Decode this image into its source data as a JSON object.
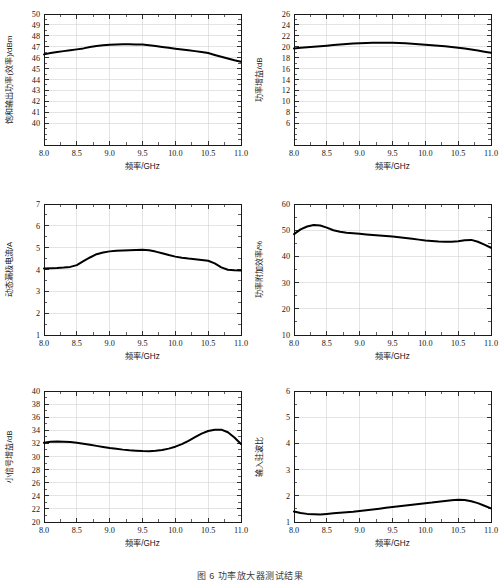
{
  "figure": {
    "caption": "图 6   功率放大器测试结果",
    "background": "#ffffff",
    "curve_color": "#000000",
    "grid_color": "#d2d2d2",
    "axis_color": "#1b1b1b",
    "panel_count": 6
  },
  "chart_data": [
    {
      "id": "saturated-output-power",
      "type": "line",
      "title": "",
      "xlabel": "频率/GHz",
      "ylabel": "饱和输出功率(效率)/dBm",
      "xlim": [
        8.0,
        11.0
      ],
      "ylim": [
        38.0,
        50.0
      ],
      "yticks": [
        40,
        41,
        42,
        43,
        44,
        45,
        46,
        47,
        48,
        49,
        50
      ],
      "xticks": [
        8.0,
        8.5,
        9.0,
        9.5,
        10.0,
        10.5,
        11.0
      ],
      "xticklabels": [
        "8.0",
        "8.5",
        "9.0",
        "9.5",
        "10.0",
        "10.5",
        "11.0"
      ],
      "yticklabels": [
        "40",
        "41",
        "42",
        "43",
        "44",
        "45",
        "46",
        "47",
        "48",
        "49",
        "50"
      ],
      "grid": true,
      "legend": "none",
      "x": [
        8.0,
        8.1,
        8.2,
        8.3,
        8.4,
        8.5,
        8.6,
        8.7,
        8.8,
        8.9,
        9.0,
        9.1,
        9.2,
        9.3,
        9.4,
        9.5,
        9.6,
        9.7,
        9.8,
        9.9,
        10.0,
        10.1,
        10.2,
        10.3,
        10.4,
        10.5,
        10.6,
        10.7,
        10.8,
        10.9,
        11.0
      ],
      "y": [
        46.3,
        46.42,
        46.52,
        46.6,
        46.68,
        46.76,
        46.85,
        46.97,
        47.07,
        47.14,
        47.18,
        47.21,
        47.22,
        47.22,
        47.21,
        47.2,
        47.14,
        47.06,
        46.98,
        46.9,
        46.82,
        46.75,
        46.68,
        46.6,
        46.52,
        46.42,
        46.25,
        46.08,
        45.92,
        45.76,
        45.62
      ]
    },
    {
      "id": "power-gain",
      "type": "line",
      "title": "",
      "xlabel": "频率/GHz",
      "ylabel": "功率增益/dB",
      "xlim": [
        8.0,
        11.0
      ],
      "ylim": [
        2.0,
        26.0
      ],
      "yticks": [
        6,
        8,
        10,
        12,
        14,
        16,
        18,
        20,
        22,
        24,
        26
      ],
      "xticks": [
        8.0,
        8.5,
        9.0,
        9.5,
        10.0,
        10.5,
        11.0
      ],
      "xticklabels": [
        "8.0",
        "8.5",
        "9.0",
        "9.5",
        "10.0",
        "10.5",
        "11.0"
      ],
      "yticklabels": [
        "6",
        "8",
        "10",
        "12",
        "14",
        "16",
        "18",
        "20",
        "22",
        "24",
        "26"
      ],
      "grid": true,
      "legend": "none",
      "x": [
        8.0,
        8.1,
        8.2,
        8.3,
        8.4,
        8.5,
        8.6,
        8.7,
        8.8,
        8.9,
        9.0,
        9.1,
        9.2,
        9.3,
        9.4,
        9.5,
        9.6,
        9.7,
        9.8,
        9.9,
        10.0,
        10.1,
        10.2,
        10.3,
        10.4,
        10.5,
        10.6,
        10.7,
        10.8,
        10.9,
        11.0
      ],
      "y": [
        19.7,
        19.82,
        19.92,
        20.0,
        20.08,
        20.18,
        20.3,
        20.42,
        20.52,
        20.6,
        20.66,
        20.7,
        20.73,
        20.75,
        20.75,
        20.74,
        20.7,
        20.63,
        20.55,
        20.46,
        20.37,
        20.28,
        20.18,
        20.08,
        19.96,
        19.82,
        19.66,
        19.48,
        19.3,
        19.1,
        18.9
      ]
    },
    {
      "id": "dynamic-drain-current",
      "type": "line",
      "title": "",
      "xlabel": "频率/GHz",
      "ylabel": "动态漏极电流/A",
      "xlim": [
        8.0,
        11.0
      ],
      "ylim": [
        1.0,
        7.0
      ],
      "yticks": [
        1,
        2,
        3,
        4,
        5,
        6,
        7
      ],
      "xticks": [
        8.0,
        8.5,
        9.0,
        9.5,
        10.0,
        10.5,
        11.0
      ],
      "xticklabels": [
        "8.0",
        "8.5",
        "9.0",
        "9.5",
        "10.0",
        "10.5",
        "11.0"
      ],
      "yticklabels": [
        "1",
        "2",
        "3",
        "4",
        "5",
        "6",
        "7"
      ],
      "grid": true,
      "legend": "none",
      "x": [
        8.0,
        8.1,
        8.2,
        8.3,
        8.4,
        8.5,
        8.6,
        8.7,
        8.8,
        8.9,
        9.0,
        9.1,
        9.2,
        9.3,
        9.4,
        9.5,
        9.6,
        9.7,
        9.8,
        9.9,
        10.0,
        10.1,
        10.2,
        10.3,
        10.4,
        10.5,
        10.6,
        10.7,
        10.8,
        10.9,
        11.0
      ],
      "y": [
        4.05,
        4.06,
        4.07,
        4.09,
        4.12,
        4.2,
        4.38,
        4.55,
        4.7,
        4.78,
        4.83,
        4.86,
        4.87,
        4.88,
        4.89,
        4.9,
        4.88,
        4.82,
        4.74,
        4.66,
        4.59,
        4.54,
        4.5,
        4.47,
        4.44,
        4.4,
        4.28,
        4.1,
        3.99,
        3.96,
        3.95
      ]
    },
    {
      "id": "power-added-efficiency",
      "type": "line",
      "title": "",
      "xlabel": "频率/GHz",
      "ylabel": "功率附加效率/%",
      "xlim": [
        8.0,
        11.0
      ],
      "ylim": [
        10.0,
        60.0
      ],
      "yticks": [
        10,
        20,
        30,
        40,
        50,
        60
      ],
      "xticks": [
        8.0,
        8.5,
        9.0,
        9.5,
        10.0,
        10.5,
        11.0
      ],
      "xticklabels": [
        "8.0",
        "8.5",
        "9.0",
        "9.5",
        "10.0",
        "10.5",
        "11.0"
      ],
      "yticklabels": [
        "10",
        "20",
        "30",
        "40",
        "50",
        "60"
      ],
      "grid": true,
      "legend": "none",
      "x": [
        8.0,
        8.1,
        8.2,
        8.3,
        8.4,
        8.5,
        8.6,
        8.7,
        8.8,
        8.9,
        9.0,
        9.1,
        9.2,
        9.3,
        9.4,
        9.5,
        9.6,
        9.7,
        9.8,
        9.9,
        10.0,
        10.1,
        10.2,
        10.3,
        10.4,
        10.5,
        10.6,
        10.7,
        10.8,
        10.9,
        11.0
      ],
      "y": [
        48.5,
        50.3,
        51.4,
        52.0,
        51.8,
        51.0,
        50.0,
        49.4,
        49.0,
        48.8,
        48.6,
        48.4,
        48.2,
        48.0,
        47.8,
        47.6,
        47.3,
        47.0,
        46.7,
        46.4,
        46.1,
        45.9,
        45.7,
        45.6,
        45.6,
        45.8,
        46.2,
        46.3,
        45.6,
        44.5,
        43.3
      ]
    },
    {
      "id": "small-signal-gain",
      "type": "line",
      "title": "",
      "xlabel": "频率/GHz",
      "ylabel": "小信号增益/dB",
      "xlim": [
        8.0,
        11.0
      ],
      "ylim": [
        20.0,
        40.0
      ],
      "yticks": [
        20,
        22,
        24,
        26,
        28,
        30,
        32,
        34,
        36,
        38,
        40
      ],
      "xticks": [
        8.0,
        8.5,
        9.0,
        9.5,
        10.0,
        10.5,
        11.0
      ],
      "xticklabels": [
        "8.0",
        "8.5",
        "9.0",
        "9.5",
        "10.0",
        "10.5",
        "11.0"
      ],
      "yticklabels": [
        "20",
        "22",
        "24",
        "26",
        "28",
        "30",
        "32",
        "34",
        "36",
        "38",
        "40"
      ],
      "grid": true,
      "legend": "none",
      "x": [
        8.0,
        8.1,
        8.2,
        8.3,
        8.4,
        8.5,
        8.6,
        8.7,
        8.8,
        8.9,
        9.0,
        9.1,
        9.2,
        9.3,
        9.4,
        9.5,
        9.6,
        9.7,
        9.8,
        9.9,
        10.0,
        10.1,
        10.2,
        10.3,
        10.4,
        10.5,
        10.6,
        10.7,
        10.8,
        10.9,
        11.0
      ],
      "y": [
        32.1,
        32.25,
        32.3,
        32.27,
        32.2,
        32.1,
        31.95,
        31.8,
        31.62,
        31.45,
        31.3,
        31.18,
        31.05,
        30.95,
        30.88,
        30.83,
        30.82,
        30.88,
        31.0,
        31.2,
        31.5,
        31.9,
        32.4,
        32.95,
        33.5,
        33.9,
        34.08,
        34.1,
        33.7,
        32.9,
        31.9
      ]
    },
    {
      "id": "input-vswr",
      "type": "line",
      "title": "",
      "xlabel": "频率/GHz",
      "ylabel": "输入驻波比",
      "xlim": [
        8.0,
        11.0
      ],
      "ylim": [
        1.0,
        6.0
      ],
      "yticks": [
        1,
        2,
        3,
        4,
        5,
        6
      ],
      "xticks": [
        8.0,
        8.5,
        9.0,
        9.5,
        10.0,
        10.5,
        11.0
      ],
      "xticklabels": [
        "8.0",
        "8.5",
        "9.0",
        "9.5",
        "10.0",
        "10.5",
        "11.0"
      ],
      "yticklabels": [
        "1",
        "2",
        "3",
        "4",
        "5",
        "6"
      ],
      "grid": true,
      "legend": "none",
      "x": [
        8.0,
        8.1,
        8.2,
        8.3,
        8.4,
        8.5,
        8.6,
        8.7,
        8.8,
        8.9,
        9.0,
        9.1,
        9.2,
        9.3,
        9.4,
        9.5,
        9.6,
        9.7,
        9.8,
        9.9,
        10.0,
        10.1,
        10.2,
        10.3,
        10.4,
        10.5,
        10.6,
        10.7,
        10.8,
        10.9,
        11.0
      ],
      "y": [
        1.4,
        1.34,
        1.31,
        1.3,
        1.29,
        1.31,
        1.33,
        1.35,
        1.37,
        1.39,
        1.42,
        1.45,
        1.48,
        1.51,
        1.54,
        1.57,
        1.6,
        1.63,
        1.66,
        1.69,
        1.72,
        1.74,
        1.77,
        1.8,
        1.83,
        1.85,
        1.84,
        1.79,
        1.72,
        1.62,
        1.52
      ]
    }
  ]
}
